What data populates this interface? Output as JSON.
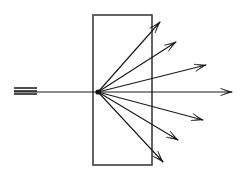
{
  "figure": {
    "title": "Scattering of an incident beam by a slab target",
    "background_color": "#ffffff",
    "ink_color": "#1a1a1a",
    "slab_border_color": "#3d3d3d",
    "width": 245,
    "height": 179
  },
  "chart_data": {
    "type": "diagram",
    "title": "Scattering of an incident beam by a slab target",
    "xlabel": "",
    "ylabel": "",
    "xlim": [
      0,
      245
    ],
    "ylim": [
      0,
      179
    ],
    "grid": false,
    "legend_position": "none",
    "coordinate_note": "pixel coordinates, origin top-left, y increases downward",
    "scattering_vertex": {
      "x": 98,
      "y": 92
    },
    "slab": {
      "name": "target-slab",
      "x": 93,
      "y": 15,
      "width": 59,
      "height": 150,
      "left": 93,
      "right": 152,
      "top": 15,
      "bottom": 165,
      "fill": "#ffffff",
      "stroke": "#3d3d3d",
      "stroke_width": 1.6
    },
    "incident_beam": {
      "name": "incident-beam",
      "from": {
        "x": 14,
        "y": 92
      },
      "to": {
        "x": 98,
        "y": 92
      },
      "has_arrow_head": false,
      "hatch_marks": [
        {
          "x1": 14,
          "y1": 88,
          "x2": 37,
          "y2": 88
        },
        {
          "x1": 14,
          "y1": 91,
          "x2": 37,
          "y2": 91
        },
        {
          "x1": 14,
          "y1": 94,
          "x2": 37,
          "y2": 94
        }
      ]
    },
    "scattered_rays": [
      {
        "name": "ray-up-steep",
        "index": 1,
        "to": {
          "x": 160,
          "y": 22
        },
        "angle_deg": 46.5,
        "length": 89.9,
        "has_arrow_head": true
      },
      {
        "name": "ray-up-mid",
        "index": 2,
        "to": {
          "x": 176,
          "y": 42
        },
        "angle_deg": 32.7,
        "length": 92.7,
        "has_arrow_head": true
      },
      {
        "name": "ray-up-shallow",
        "index": 3,
        "to": {
          "x": 206,
          "y": 65
        },
        "angle_deg": 14.0,
        "length": 111.3,
        "has_arrow_head": true
      },
      {
        "name": "ray-forward",
        "index": 4,
        "to": {
          "x": 232,
          "y": 92
        },
        "angle_deg": 0.0,
        "length": 134.0,
        "has_arrow_head": true
      },
      {
        "name": "ray-down-shallow",
        "index": 5,
        "to": {
          "x": 203,
          "y": 120
        },
        "angle_deg": -14.9,
        "length": 108.7,
        "has_arrow_head": true
      },
      {
        "name": "ray-down-mid",
        "index": 6,
        "to": {
          "x": 178,
          "y": 140
        },
        "angle_deg": -29.0,
        "length": 91.5,
        "has_arrow_head": true
      },
      {
        "name": "ray-down-steep",
        "index": 7,
        "to": {
          "x": 163,
          "y": 162
        },
        "angle_deg": -46.9,
        "length": 95.3,
        "has_arrow_head": true
      }
    ],
    "counts": {
      "scattered_rays": 7,
      "incident_rays": 1,
      "hatch_marks": 3
    }
  }
}
